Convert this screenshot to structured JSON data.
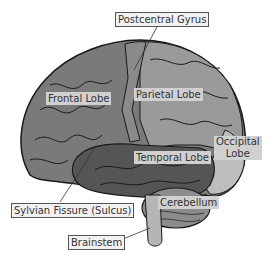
{
  "diagram": {
    "labels": {
      "postcentral_gyrus": "Postcentral Gyrus",
      "frontal_lobe": "Frontal Lobe",
      "parietal_lobe": "Parietal Lobe",
      "temporal_lobe": "Temporal Lobe",
      "occipital_lobe_line1": "Occipital",
      "occipital_lobe_line2": "Lobe",
      "sylvian_fissure": "Sylvian Fissure (Sulcus)",
      "cerebellum": "Cerebellum",
      "brainstem": "Brainstem"
    },
    "colors": {
      "frontal": "#7a7a7a",
      "parietal": "#9a9a9a",
      "postcentral": "#8a8a8a",
      "temporal": "#555555",
      "occipital": "#bdbdbd",
      "cerebellum": "#8c8c8c",
      "brainstem": "#b5b5b5",
      "outline": "#1a1a1a"
    }
  }
}
